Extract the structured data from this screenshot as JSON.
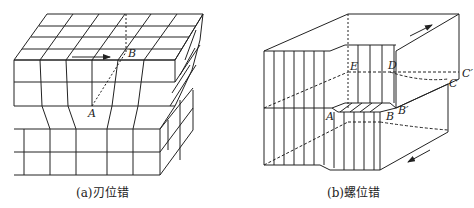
{
  "top_partial_text": "...",
  "figure_a": {
    "caption": "(a)刃位错",
    "labels": {
      "A": "A",
      "B": "B"
    }
  },
  "figure_b": {
    "caption": "(b)螺位错",
    "labels": {
      "A": "A",
      "B": "B",
      "B_prime": "B′",
      "C": "C",
      "C_prime": "C′",
      "D": "D",
      "E": "E"
    }
  },
  "colors": {
    "line": "#222222",
    "background": "#ffffff"
  }
}
